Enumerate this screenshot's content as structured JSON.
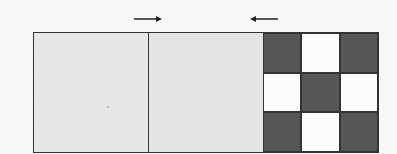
{
  "arrows": [
    {
      "direction": "right",
      "icon": "arrow-right-icon"
    },
    {
      "direction": "left",
      "icon": "arrow-left-icon"
    }
  ],
  "panels": [
    {
      "name": "hatched-gray-panel",
      "fill": "#e6e6e6"
    },
    {
      "name": "plain-gray-panel",
      "fill": "#e4e4e4"
    },
    {
      "name": "checkerboard-panel",
      "rows": 3,
      "cols": 3,
      "pattern": [
        [
          "dark",
          "light",
          "dark"
        ],
        [
          "light",
          "dark",
          "light"
        ],
        [
          "dark",
          "light",
          "dark"
        ]
      ]
    }
  ],
  "colors": {
    "border": "#333333",
    "dark": "#565656",
    "light": "#fbfbfb",
    "gray": "#e6e6e6"
  }
}
